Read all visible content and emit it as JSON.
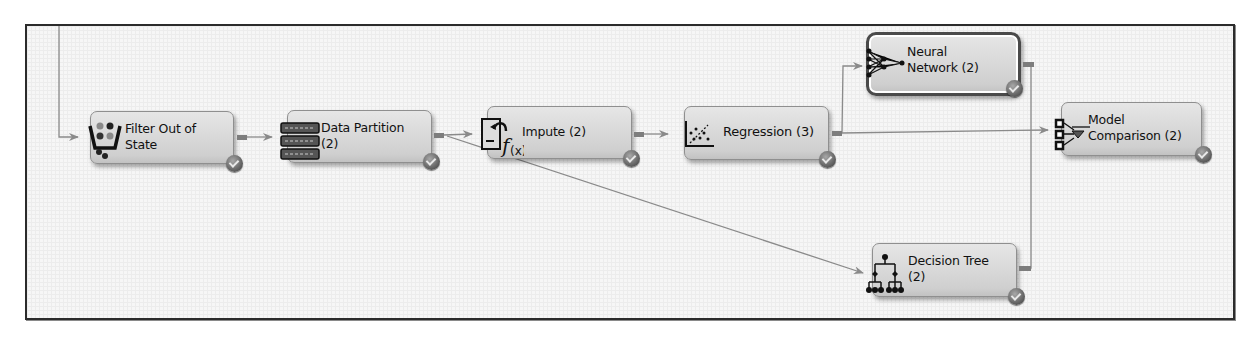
{
  "diagram": {
    "type": "process-flow",
    "nodes": [
      {
        "id": "filter",
        "label": "Filter Out of\nState",
        "icon": "filter-basket-icon",
        "status": "completed"
      },
      {
        "id": "partition",
        "label": "Data Partition\n(2)",
        "icon": "data-partition-icon",
        "status": "completed"
      },
      {
        "id": "impute",
        "label": "Impute (2)",
        "icon": "impute-function-icon",
        "status": "completed"
      },
      {
        "id": "regression",
        "label": "Regression (3)",
        "icon": "regression-scatter-icon",
        "status": "completed"
      },
      {
        "id": "neural",
        "label": "Neural\nNetwork (2)",
        "icon": "neural-network-icon",
        "status": "completed",
        "selected": true
      },
      {
        "id": "tree",
        "label": "Decision Tree\n(2)",
        "icon": "decision-tree-icon",
        "status": "completed"
      },
      {
        "id": "compare",
        "label": "Model\nComparison (2)",
        "icon": "model-comparison-icon",
        "status": "completed"
      }
    ],
    "edges": [
      {
        "from": "(upstream)",
        "to": "filter"
      },
      {
        "from": "filter",
        "to": "partition"
      },
      {
        "from": "partition",
        "to": "impute"
      },
      {
        "from": "partition",
        "to": "tree"
      },
      {
        "from": "impute",
        "to": "regression"
      },
      {
        "from": "regression",
        "to": "neural"
      },
      {
        "from": "regression",
        "to": "compare"
      },
      {
        "from": "neural",
        "to": "compare"
      },
      {
        "from": "tree",
        "to": "compare"
      }
    ]
  },
  "colors": {
    "node_fill": "#d6d6d6",
    "wire": "#8a8a8a",
    "border": "#2b2b2b"
  }
}
